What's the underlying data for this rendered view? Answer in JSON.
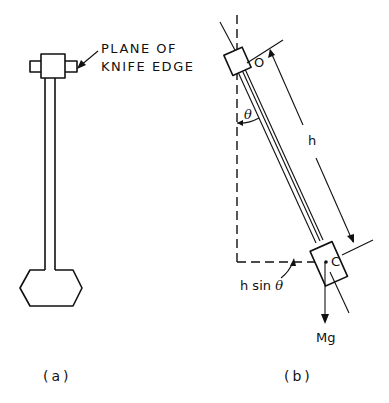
{
  "figure": {
    "panel_a": {
      "label_line1": "PLANE OF",
      "label_line2": "KNIFE EDGE",
      "caption": "(a)"
    },
    "panel_b": {
      "pivot_label": "O",
      "angle_label": "θ",
      "length_label": "h",
      "center_label": "C",
      "offset_label_h": "h sin",
      "offset_label_theta": "θ",
      "force_label": "Mg",
      "caption": "(b)"
    }
  }
}
